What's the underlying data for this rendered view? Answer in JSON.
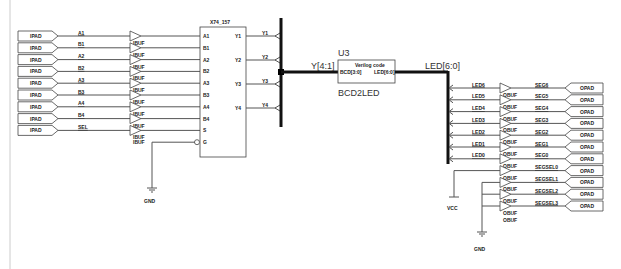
{
  "frame": {
    "left_border_color": "#cccccc"
  },
  "input_pads": {
    "pad_label": "IPAD",
    "buffer_label": "IBUF",
    "nets": [
      "A1",
      "B1",
      "A2",
      "B2",
      "A3",
      "B3",
      "A4",
      "B4",
      "SEL"
    ]
  },
  "mux": {
    "name": "X74_157",
    "inputs": [
      "A1",
      "B1",
      "A2",
      "B2",
      "A3",
      "B3",
      "A4",
      "B4",
      "S",
      "G"
    ],
    "outputs": [
      "Y1",
      "Y2",
      "Y3",
      "Y4"
    ],
    "output_nets": [
      "Y1",
      "Y2",
      "Y3",
      "Y4"
    ]
  },
  "gnd_left": {
    "label": "GND"
  },
  "decoder": {
    "instance": "U3",
    "type": "BCD2LED",
    "title": "Verilog code",
    "in_pin": "BCD[3:0]",
    "out_pin": "LED[6:0]",
    "in_bus_label": "Y[4:1]",
    "out_bus_label": "LED[6:0]"
  },
  "output_section": {
    "led_nets": [
      "LED6",
      "LED5",
      "LED4",
      "LED3",
      "LED2",
      "LED1",
      "LED0"
    ],
    "buffer_label": "OBUF",
    "pad_label": "OPAD",
    "out_nets": [
      "SEG6",
      "SEG5",
      "SEG4",
      "SEG3",
      "SEG2",
      "SEG1",
      "SEG0",
      "SEGSEL0",
      "SEGSEL1",
      "SEGSEL2",
      "SEGSEL3"
    ],
    "vcc_label": "VCC",
    "gnd_label": "GND"
  }
}
